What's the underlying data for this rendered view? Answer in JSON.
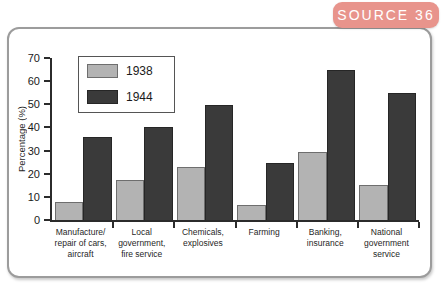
{
  "source_tab": {
    "label": "SOURCE 36"
  },
  "colors": {
    "tab_bg": "#e8948c",
    "tab_text": "#ffffff",
    "panel_border": "#9c9c9c",
    "axis": "#2b2b2b",
    "series_1938": "#b3b3b3",
    "series_1938_border": "#6e6e6e",
    "series_1944": "#3a3a3a",
    "series_1944_border": "#262626"
  },
  "chart_data": {
    "type": "bar",
    "title": "",
    "xlabel": "",
    "ylabel": "Percentage (%)",
    "ylim": [
      0,
      70
    ],
    "yticks": [
      0,
      10,
      20,
      30,
      40,
      50,
      60,
      70
    ],
    "grid": false,
    "legend_position": "top-left inside plot",
    "categories": [
      "Manufacture/repair of cars, aircraft",
      "Local government, fire service",
      "Chemicals, explosives",
      "Farming",
      "Banking, insurance",
      "National government service"
    ],
    "category_label_lines": [
      [
        "Manufacture/",
        "repair of cars,",
        "aircraft"
      ],
      [
        "Local",
        "government,",
        "fire service"
      ],
      [
        "Chemicals,",
        "explosives"
      ],
      [
        "Farming"
      ],
      [
        "Banking,",
        "insurance"
      ],
      [
        "National",
        "government",
        "service"
      ]
    ],
    "series": [
      {
        "name": "1938",
        "color": "#b3b3b3",
        "values": [
          8,
          17.5,
          23,
          6.5,
          29.5,
          15
        ]
      },
      {
        "name": "1944",
        "color": "#3a3a3a",
        "values": [
          36,
          40,
          49.5,
          24.5,
          65,
          55
        ]
      }
    ]
  }
}
